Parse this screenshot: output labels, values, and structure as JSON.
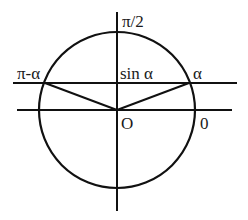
{
  "diagram": {
    "labels": {
      "top_axis": "π/2",
      "left_point": "π-α",
      "sine_line": "sin α",
      "right_point": "α",
      "origin": "O",
      "zero_angle": "0"
    },
    "colors": {
      "line": "#111111",
      "text": "#1a1a1a",
      "background": "#ffffff"
    }
  }
}
